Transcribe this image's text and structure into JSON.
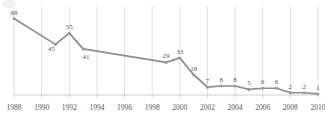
{
  "chart_data": {
    "type": "line",
    "title": "",
    "subtitle": "",
    "xlabel": "",
    "ylabel": "",
    "grid": "vertical-only",
    "legend": "none",
    "xlim": [
      1988,
      2010
    ],
    "ylim": [
      0,
      72
    ],
    "x_tick_labels": [
      "1988",
      "1990",
      "1992",
      "1994",
      "1996",
      "1998",
      "2000",
      "2002",
      "2004",
      "2006",
      "2008",
      "2010"
    ],
    "x_tick_values": [
      1988,
      1990,
      1992,
      1994,
      1996,
      1998,
      2000,
      2002,
      2004,
      2006,
      2008,
      2010
    ],
    "series": [
      {
        "name": "series-1",
        "color": "#8d8d8d",
        "x": [
          1988,
          1991,
          1992,
          1993,
          1999,
          2000,
          2001,
          2002,
          2003,
          2004,
          2005,
          2006,
          2007,
          2008,
          2009,
          2010
        ],
        "values": [
          68,
          45,
          55,
          41,
          29,
          33,
          18,
          7,
          8,
          8,
          5,
          6,
          6,
          2,
          2,
          1
        ],
        "point_labels": [
          "68",
          "45",
          "55",
          "41",
          "29",
          "33",
          "18",
          "7",
          "8",
          "8",
          "5",
          "6",
          "6",
          "2",
          "2",
          "1"
        ]
      }
    ]
  },
  "colors": {
    "line": "#8d8d8d",
    "marker": "#9a9a9a",
    "gridline": "#d9d9d9",
    "axis": "#d0d0d0",
    "label_text": "#555555",
    "tick_text": "#595959",
    "background": "#ffffff"
  }
}
